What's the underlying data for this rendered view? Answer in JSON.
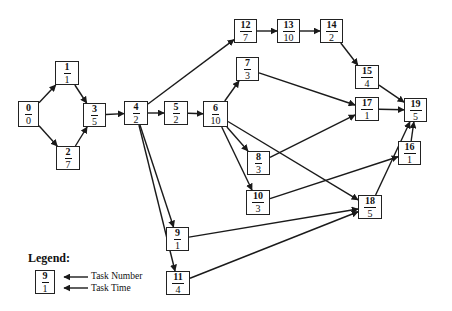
{
  "nodes": [
    {
      "id": "0",
      "number": "0",
      "time": "0",
      "x": 18,
      "y": 101,
      "w": 21,
      "h": 26
    },
    {
      "id": "1",
      "number": "1",
      "time": "1",
      "x": 55,
      "y": 61,
      "w": 24,
      "h": 24
    },
    {
      "id": "2",
      "number": "2",
      "time": "7",
      "x": 56,
      "y": 146,
      "w": 24,
      "h": 24
    },
    {
      "id": "3",
      "number": "3",
      "time": "5",
      "x": 83,
      "y": 103,
      "w": 23,
      "h": 24
    },
    {
      "id": "4",
      "number": "4",
      "time": "2",
      "x": 124,
      "y": 101,
      "w": 24,
      "h": 24
    },
    {
      "id": "5",
      "number": "5",
      "time": "2",
      "x": 164,
      "y": 101,
      "w": 24,
      "h": 24
    },
    {
      "id": "6",
      "number": "6",
      "time": "10",
      "x": 203,
      "y": 101,
      "w": 25,
      "h": 26
    },
    {
      "id": "7",
      "number": "7",
      "time": "3",
      "x": 236,
      "y": 57,
      "w": 23,
      "h": 24
    },
    {
      "id": "8",
      "number": "8",
      "time": "3",
      "x": 247,
      "y": 151,
      "w": 23,
      "h": 24
    },
    {
      "id": "9",
      "number": "9",
      "time": "1",
      "x": 166,
      "y": 227,
      "w": 23,
      "h": 24
    },
    {
      "id": "10",
      "number": "10",
      "time": "3",
      "x": 246,
      "y": 190,
      "w": 24,
      "h": 25
    },
    {
      "id": "11",
      "number": "11",
      "time": "4",
      "x": 166,
      "y": 271,
      "w": 24,
      "h": 24
    },
    {
      "id": "12",
      "number": "12",
      "time": "7",
      "x": 234,
      "y": 19,
      "w": 23,
      "h": 24
    },
    {
      "id": "13",
      "number": "13",
      "time": "10",
      "x": 277,
      "y": 19,
      "w": 23,
      "h": 24
    },
    {
      "id": "14",
      "number": "14",
      "time": "2",
      "x": 320,
      "y": 19,
      "w": 23,
      "h": 24
    },
    {
      "id": "15",
      "number": "15",
      "time": "4",
      "x": 355,
      "y": 65,
      "w": 24,
      "h": 24
    },
    {
      "id": "16",
      "number": "16",
      "time": "1",
      "x": 398,
      "y": 141,
      "w": 23,
      "h": 24
    },
    {
      "id": "17",
      "number": "17",
      "time": "1",
      "x": 355,
      "y": 97,
      "w": 24,
      "h": 24
    },
    {
      "id": "18",
      "number": "18",
      "time": "5",
      "x": 358,
      "y": 195,
      "w": 24,
      "h": 24
    },
    {
      "id": "19",
      "number": "19",
      "time": "5",
      "x": 404,
      "y": 98,
      "w": 23,
      "h": 24
    }
  ],
  "edges": [
    [
      "0",
      "1"
    ],
    [
      "0",
      "2"
    ],
    [
      "1",
      "3"
    ],
    [
      "2",
      "3"
    ],
    [
      "3",
      "4"
    ],
    [
      "4",
      "12"
    ],
    [
      "4",
      "5"
    ],
    [
      "4",
      "9"
    ],
    [
      "4",
      "11"
    ],
    [
      "5",
      "6"
    ],
    [
      "6",
      "7"
    ],
    [
      "6",
      "8"
    ],
    [
      "6",
      "10"
    ],
    [
      "6",
      "18"
    ],
    [
      "7",
      "17"
    ],
    [
      "8",
      "17"
    ],
    [
      "10",
      "16"
    ],
    [
      "12",
      "13"
    ],
    [
      "13",
      "14"
    ],
    [
      "14",
      "15"
    ],
    [
      "15",
      "19"
    ],
    [
      "17",
      "19"
    ],
    [
      "16",
      "19"
    ],
    [
      "18",
      "19"
    ],
    [
      "9",
      "18"
    ],
    [
      "11",
      "18"
    ]
  ],
  "legend": {
    "title": "Legend:",
    "sample_number": "9",
    "sample_time": "1",
    "number_label": "Task Number",
    "time_label": "Task Time"
  },
  "colors": {
    "line": "#1a1a1a",
    "box_border": "#222222",
    "background": "#ffffff"
  }
}
